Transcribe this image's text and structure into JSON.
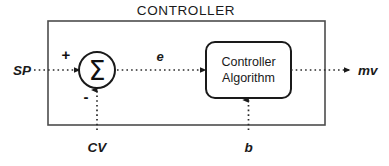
{
  "diagram": {
    "type": "control-loop-block-diagram",
    "title": "CONTROLLER",
    "background_color": "#ffffff",
    "line_color": "#1a1a1a",
    "border_color": "#4d4d4d",
    "blocks": [
      {
        "id": "summing-junction",
        "shape": "circle",
        "label": "Σ",
        "signs": {
          "plus": "+",
          "minus": "-"
        }
      },
      {
        "id": "controller-algorithm",
        "shape": "rounded-rect",
        "label_line_1": "Controller",
        "label_line_2": "Algorithm"
      }
    ],
    "signals": [
      {
        "id": "sp",
        "label": "SP",
        "position": "left-input",
        "style": "dotted"
      },
      {
        "id": "e",
        "label": "e",
        "position": "mid-top",
        "style": "dotted"
      },
      {
        "id": "mv",
        "label": "mv",
        "position": "right-output",
        "style": "dotted"
      },
      {
        "id": "cv",
        "label": "CV",
        "position": "bottom-left-input",
        "style": "dotted"
      },
      {
        "id": "b",
        "label": "b",
        "position": "bottom-right-input",
        "style": "dotted"
      }
    ],
    "labels": {
      "sp": "SP",
      "e": "e",
      "mv": "mv",
      "cv": "CV",
      "b": "b",
      "sigma": "Σ",
      "plus": "+",
      "minus": "-",
      "controller_line1": "Controller",
      "controller_line2": "Algorithm",
      "title": "CONTROLLER"
    }
  }
}
